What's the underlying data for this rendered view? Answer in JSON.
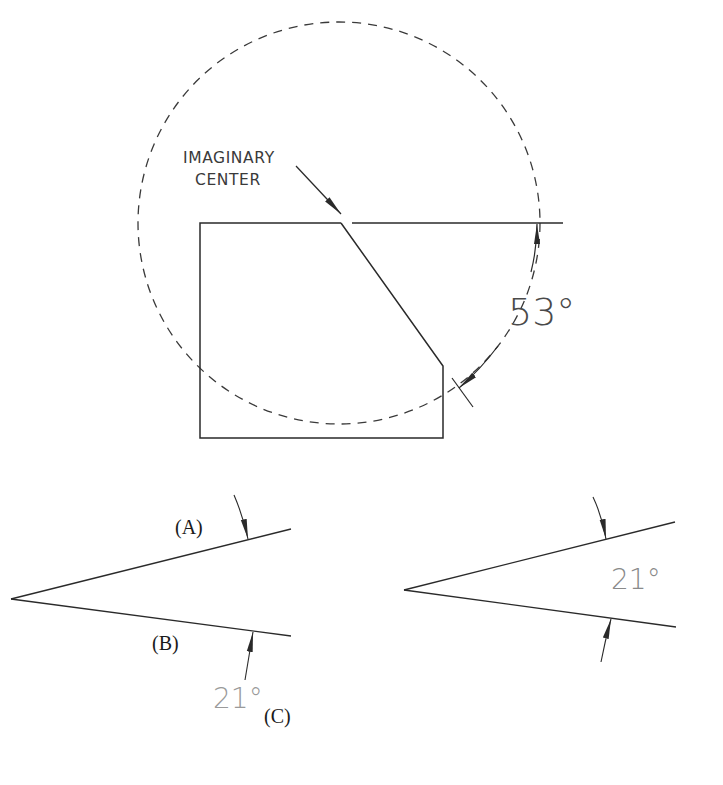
{
  "colors": {
    "line": "#3a3a3a",
    "dimension_text_dark": "#4a4a4a",
    "dimension_text_light": "#9a9a9a",
    "background": "#ffffff"
  },
  "top_figure": {
    "label_line1": "IMAGINARY",
    "label_line2": "CENTER",
    "angle_label": "53°"
  },
  "bottom_left_figure": {
    "label_a": "(A)",
    "label_b": "(B)",
    "label_c": "(C)",
    "angle_label": "21°"
  },
  "bottom_right_figure": {
    "angle_label": "21°"
  }
}
